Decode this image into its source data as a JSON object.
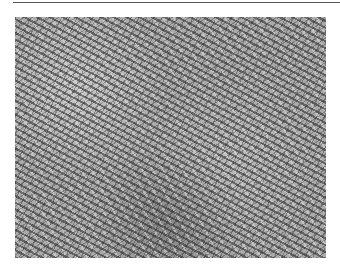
{
  "figure": {
    "colors": {
      "background": "#ffffff",
      "tissue_mid": "#a9a9a9",
      "nuclei": "#333333",
      "top_rule": "#555555"
    }
  }
}
